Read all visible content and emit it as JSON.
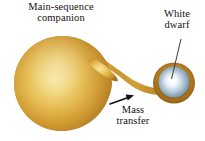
{
  "figure": {
    "type": "astronomy-diagram",
    "background_color": "#ffffff",
    "text_color": "#14100d"
  },
  "labels": {
    "companion": {
      "line1": "Main-sequence",
      "line2": "companion"
    },
    "white_dwarf": {
      "line1": "White",
      "line2": "dwarf"
    },
    "mass_transfer": {
      "line1": "Mass",
      "line2": "transfer"
    }
  },
  "objects": {
    "companion_star": {
      "name": "main-sequence-companion-star",
      "shape": "teardrop",
      "center_x": 63,
      "center_y": 84,
      "radius_x": 50,
      "radius_y": 47,
      "highlight_color": "#f0d477",
      "mid_color": "#dcab3c",
      "edge_color": "#b07a22"
    },
    "white_dwarf": {
      "name": "white-dwarf-star",
      "shape": "sphere",
      "center_x": 174,
      "center_y": 82,
      "radius": 15,
      "core_color": "#ffffff",
      "inner_color": "#d9e7ef",
      "outer_color": "#8ba3b8",
      "rim_color": "#5f7b92"
    },
    "accretion_disk": {
      "name": "accretion-disk",
      "center_x": 174,
      "center_y": 82,
      "radius": 21,
      "color": "#b5801f"
    },
    "mass_stream": {
      "name": "mass-transfer-stream",
      "from_x": 112,
      "from_y": 80,
      "to_x": 160,
      "to_y": 92,
      "color": "#c99432"
    }
  },
  "annotations": {
    "leader_line_white_dwarf": {
      "name": "leader-line",
      "x1": 180,
      "y1": 40,
      "x2": 172,
      "y2": 78,
      "color": "#3a3a3a"
    },
    "arrow_mass_transfer": {
      "name": "flow-direction-arrow",
      "x1": 110,
      "y1": 103,
      "x2": 134,
      "y2": 95,
      "color": "#14100d",
      "direction": "up-right"
    }
  },
  "colors": {
    "star_gold": "#dcab3c",
    "star_gold_light": "#f0d477",
    "star_gold_dark": "#a87020",
    "dwarf_blue": "#9fb6c7",
    "dwarf_white": "#ffffff",
    "ink": "#14100d"
  }
}
